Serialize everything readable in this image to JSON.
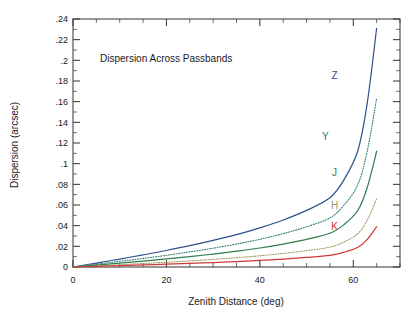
{
  "chart_data": {
    "type": "line",
    "title": "",
    "annotation": "Dispersion Across Passbands",
    "xlabel": "Zenith Distance (deg)",
    "ylabel": "Dispersion (arcsec)",
    "xlim": [
      0,
      70
    ],
    "ylim": [
      0,
      0.24
    ],
    "xticks": [
      0,
      20,
      40,
      60
    ],
    "xtick_labels": [
      "0",
      "20",
      "40",
      "60"
    ],
    "xtick_minor_step": 5,
    "yticks": [
      0,
      0.02,
      0.04,
      0.06,
      0.08,
      0.1,
      0.12,
      0.14,
      0.16,
      0.18,
      0.2,
      0.22,
      0.24
    ],
    "ytick_labels": [
      "0",
      ".02",
      ".04",
      ".06",
      ".08",
      ".1",
      ".12",
      ".14",
      ".16",
      ".18",
      ".2",
      ".22",
      ".24"
    ],
    "ytick_minor_step": 0.01,
    "grid": false,
    "legend_position": "inline-right",
    "x": [
      0,
      5,
      10,
      15,
      20,
      25,
      30,
      35,
      40,
      45,
      50,
      55,
      60,
      65
    ],
    "series": [
      {
        "name": "Z",
        "label": "Z",
        "color": "#2f4f8f",
        "style": "solid",
        "label_x": 56,
        "label_y": 0.182,
        "values": [
          0.0,
          0.0038,
          0.0077,
          0.0117,
          0.016,
          0.0206,
          0.0257,
          0.0313,
          0.0378,
          0.0455,
          0.0548,
          0.067,
          0.0843,
          0.113,
          0.159,
          0.231
        ],
        "x_values": [
          0,
          5,
          10,
          15,
          20,
          25,
          30,
          35,
          40,
          45,
          50,
          55,
          58,
          61,
          63,
          65
        ]
      },
      {
        "name": "Y",
        "label": "Y",
        "color": "#2e7d70",
        "style": "dotted",
        "label_x": 54,
        "label_y": 0.123,
        "values": [
          0.0,
          0.0027,
          0.0055,
          0.0083,
          0.0113,
          0.0146,
          0.0182,
          0.0222,
          0.0268,
          0.0323,
          0.0389,
          0.0475,
          0.0598,
          0.08,
          0.1125,
          0.163
        ],
        "x_values": [
          0,
          5,
          10,
          15,
          20,
          25,
          30,
          35,
          40,
          45,
          50,
          55,
          58,
          61,
          63,
          65
        ]
      },
      {
        "name": "J",
        "label": "J",
        "color": "#2f7d4f",
        "style": "solid",
        "label_x": 56,
        "label_y": 0.088,
        "values": [
          0.0,
          0.0019,
          0.0038,
          0.0057,
          0.0078,
          0.01,
          0.0125,
          0.0153,
          0.0184,
          0.0222,
          0.0267,
          0.0326,
          0.041,
          0.0549,
          0.0772,
          0.112
        ],
        "x_values": [
          0,
          5,
          10,
          15,
          20,
          25,
          30,
          35,
          40,
          45,
          50,
          55,
          58,
          61,
          63,
          65
        ]
      },
      {
        "name": "H",
        "label": "H",
        "color": "#9a9a5c",
        "style": "dotted",
        "label_x": 56,
        "label_y": 0.0565,
        "values": [
          0.0,
          0.0011,
          0.0022,
          0.0034,
          0.0046,
          0.0059,
          0.0074,
          0.009,
          0.0109,
          0.0131,
          0.0158,
          0.0192,
          0.0242,
          0.0324,
          0.0455,
          0.066
        ],
        "x_values": [
          0,
          5,
          10,
          15,
          20,
          25,
          30,
          35,
          40,
          45,
          50,
          55,
          58,
          61,
          63,
          65
        ]
      },
      {
        "name": "K",
        "label": "K",
        "color": "#cc3b36",
        "style": "solid",
        "label_x": 56,
        "label_y": 0.0355,
        "values": [
          0.0,
          0.00065,
          0.00131,
          0.00199,
          0.00271,
          0.00348,
          0.00433,
          0.00529,
          0.00639,
          0.00769,
          0.00926,
          0.0113,
          0.01422,
          0.01903,
          0.02674,
          0.039
        ],
        "x_values": [
          0,
          5,
          10,
          15,
          20,
          25,
          30,
          35,
          40,
          45,
          50,
          55,
          58,
          61,
          63,
          65
        ]
      }
    ]
  },
  "colors": {
    "axis": "#333333",
    "text": "#1a1a1a",
    "background": "#ffffff"
  }
}
